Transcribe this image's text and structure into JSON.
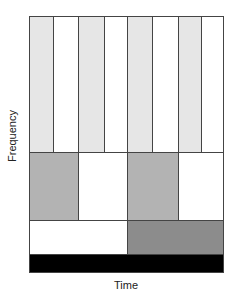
{
  "diagram": {
    "type": "time-frequency tiling",
    "xlabel": "Time",
    "ylabel": "Frequency",
    "colors": {
      "light_gray": "#e6e6e6",
      "mid_gray": "#b3b3b3",
      "dark_gray": "#8c8c8c",
      "black": "#000000",
      "white": "#ffffff"
    },
    "rows": [
      {
        "name": "row-1-highest-frequency",
        "top": 0,
        "height": 136,
        "cells": [
          {
            "left": 0,
            "width": 24,
            "fill": "#e6e6e6"
          },
          {
            "left": 24,
            "width": 25,
            "fill": "#ffffff"
          },
          {
            "left": 49,
            "width": 26,
            "fill": "#e6e6e6"
          },
          {
            "left": 75,
            "width": 23,
            "fill": "#ffffff"
          },
          {
            "left": 98,
            "width": 25,
            "fill": "#e6e6e6"
          },
          {
            "left": 123,
            "width": 26,
            "fill": "#ffffff"
          },
          {
            "left": 149,
            "width": 23,
            "fill": "#e6e6e6"
          },
          {
            "left": 172,
            "width": 22,
            "fill": "#ffffff"
          }
        ]
      },
      {
        "name": "row-2",
        "top": 136,
        "height": 68,
        "cells": [
          {
            "left": 0,
            "width": 49,
            "fill": "#b3b3b3"
          },
          {
            "left": 49,
            "width": 49,
            "fill": "#ffffff"
          },
          {
            "left": 98,
            "width": 51,
            "fill": "#b3b3b3"
          },
          {
            "left": 149,
            "width": 45,
            "fill": "#ffffff"
          }
        ]
      },
      {
        "name": "row-3",
        "top": 204,
        "height": 34,
        "cells": [
          {
            "left": 0,
            "width": 98,
            "fill": "#ffffff"
          },
          {
            "left": 98,
            "width": 96,
            "fill": "#8c8c8c"
          }
        ]
      },
      {
        "name": "row-4-lowest-frequency",
        "top": 238,
        "height": 18,
        "cells": [
          {
            "left": 0,
            "width": 194,
            "fill": "#000000"
          }
        ]
      }
    ]
  }
}
